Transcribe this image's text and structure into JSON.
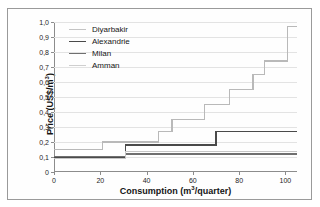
{
  "top_cropped_text": "",
  "axes": {
    "ylabel_prefix": "Price (US$/m",
    "ylabel_sup": "3",
    "ylabel_suffix": ")",
    "xlabel_prefix": "Consumption (m",
    "xlabel_sup": "3",
    "xlabel_suffix": "/quarter)"
  },
  "chart_data": {
    "type": "line",
    "subtype": "step",
    "title": "",
    "xlabel": "Consumption (m3/quarter)",
    "ylabel": "Price (US$/m3)",
    "xlim": [
      0,
      105
    ],
    "ylim": [
      0,
      1.0
    ],
    "xticks": [
      0,
      20,
      40,
      60,
      80,
      100
    ],
    "xtick_labels": [
      "0",
      "20",
      "40",
      "60",
      "80",
      "100"
    ],
    "yticks": [
      0,
      0.1,
      0.2,
      0.3,
      0.4,
      0.5,
      0.6,
      0.7,
      0.8,
      0.9,
      1.0
    ],
    "ytick_labels": [
      "0",
      "0,1",
      "0,2",
      "0,3",
      "0,4",
      "0,5",
      "0,6",
      "0,7",
      "0,8",
      "0,9",
      "1,0"
    ],
    "grid": true,
    "grid_axis": "y",
    "legend_position": "upper-left-inside",
    "decimal_separator": ",",
    "series": [
      {
        "name": "Diyarbakir",
        "color": "#b9b9b9",
        "width": 1.1,
        "steps": [
          {
            "x": 0,
            "y": 0.15
          },
          {
            "x": 21,
            "y": 0.2
          },
          {
            "x": 31,
            "y": 0.2
          },
          {
            "x": 45,
            "y": 0.27
          },
          {
            "x": 51,
            "y": 0.35
          },
          {
            "x": 60,
            "y": 0.35
          },
          {
            "x": 65,
            "y": 0.45
          },
          {
            "x": 76,
            "y": 0.55
          },
          {
            "x": 81,
            "y": 0.55
          },
          {
            "x": 86,
            "y": 0.65
          },
          {
            "x": 91,
            "y": 0.74
          },
          {
            "x": 101,
            "y": 0.97
          },
          {
            "x": 105,
            "y": 0.97
          }
        ]
      },
      {
        "name": "Alexandrie",
        "color": "#4a4a4a",
        "width": 1.4,
        "steps": [
          {
            "x": 0,
            "y": 0.095
          },
          {
            "x": 31,
            "y": 0.18
          },
          {
            "x": 70,
            "y": 0.27
          },
          {
            "x": 105,
            "y": 0.27
          }
        ]
      },
      {
        "name": "Milan",
        "color": "#6f6f6f",
        "width": 1.2,
        "steps": [
          {
            "x": 0,
            "y": 0.105
          },
          {
            "x": 31,
            "y": 0.12
          },
          {
            "x": 105,
            "y": 0.12
          }
        ]
      },
      {
        "name": "Amman",
        "color": "#c6c6c6",
        "width": 1.1,
        "steps": [
          {
            "x": 0,
            "y": 0.09
          },
          {
            "x": 31,
            "y": 0.135
          },
          {
            "x": 45,
            "y": 0.135
          },
          {
            "x": 105,
            "y": 0.135
          }
        ]
      }
    ]
  },
  "legend": {
    "items": [
      {
        "label": "Diyarbakir",
        "color": "#c4c4c4"
      },
      {
        "label": "Alexandrie",
        "color": "#4a4a4a"
      },
      {
        "label": "Milan",
        "color": "#6f6f6f"
      },
      {
        "label": "Amman",
        "color": "#cfcfcf"
      }
    ]
  }
}
